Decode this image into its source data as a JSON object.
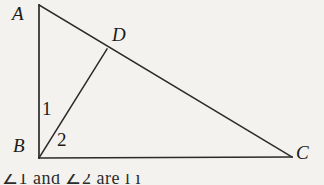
{
  "figure": {
    "kind": "geometry-diagram",
    "background_color": "#f4f2ee",
    "stroke_color": "#2b2b2b",
    "stroke_width": 1.6,
    "vertices": {
      "A": {
        "label": "A",
        "x": 39,
        "y": 5
      },
      "B": {
        "label": "B",
        "x": 39,
        "y": 158
      },
      "C": {
        "label": "C",
        "x": 292,
        "y": 157
      },
      "D": {
        "label": "D",
        "x": 107,
        "y": 49
      }
    },
    "segments": [
      {
        "name": "AB",
        "from": "A",
        "to": "B"
      },
      {
        "name": "BC",
        "from": "B",
        "to": "C"
      },
      {
        "name": "AC",
        "from": "A",
        "to": "C"
      },
      {
        "name": "BD",
        "from": "B",
        "to": "D"
      }
    ],
    "angle_labels": [
      {
        "name": "angle-1",
        "label": "1",
        "at_vertex": "B",
        "between": "AB and BD"
      },
      {
        "name": "angle-2",
        "label": "2",
        "at_vertex": "B",
        "between": "BD and BC"
      }
    ]
  },
  "caption": {
    "text": "∠1 and ∠2 are                 l            i",
    "note": "partially cropped text line at bottom edge"
  }
}
